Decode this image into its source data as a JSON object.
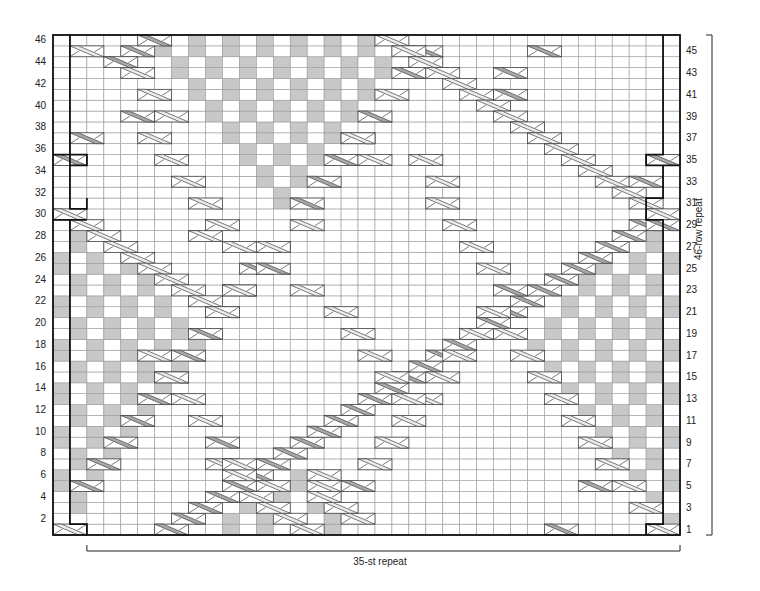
{
  "chart_data": {
    "type": "heatmap",
    "columns": 37,
    "rows": 46,
    "repeat_stitches_label": "35-st repeat",
    "repeat_rows_label": "46-row repeat",
    "left_row_labels": [
      2,
      4,
      6,
      8,
      10,
      12,
      14,
      16,
      18,
      20,
      22,
      24,
      26,
      28,
      30,
      32,
      34,
      36,
      38,
      40,
      42,
      44,
      46
    ],
    "right_row_labels": [
      1,
      3,
      5,
      7,
      9,
      11,
      13,
      15,
      17,
      19,
      21,
      23,
      25,
      27,
      29,
      31,
      33,
      35,
      37,
      39,
      41,
      43,
      45
    ],
    "colors": {
      "grid": "#9a9a9a",
      "shade": "#c8c8c8",
      "light_cross": "#ececec",
      "dark_cross": "#a8a8a8",
      "outline": "#111111"
    },
    "shaded_regions": [
      {
        "name": "top-center-diamond",
        "rows": [
          31,
          46
        ],
        "center_col": 13,
        "half_width_top": 10
      },
      {
        "name": "left-lower-triangle",
        "rows": [
          2,
          28
        ],
        "anchor": "left"
      },
      {
        "name": "right-lower-triangle",
        "rows": [
          2,
          28
        ],
        "anchor": "right"
      },
      {
        "name": "bottom-center-triangle",
        "rows": [
          1,
          6
        ],
        "center_col": 12
      }
    ],
    "crosses": [
      [
        1,
        0,
        "L"
      ],
      [
        1,
        6,
        "D"
      ],
      [
        2,
        7,
        "D"
      ],
      [
        3,
        8,
        "D"
      ],
      [
        4,
        9,
        "D"
      ],
      [
        5,
        10,
        "D"
      ],
      [
        6,
        11,
        "D"
      ],
      [
        7,
        12,
        "D"
      ],
      [
        8,
        13,
        "D"
      ],
      [
        9,
        14,
        "D"
      ],
      [
        10,
        15,
        "D"
      ],
      [
        11,
        16,
        "D"
      ],
      [
        12,
        17,
        "D"
      ],
      [
        13,
        18,
        "D"
      ],
      [
        14,
        19,
        "D"
      ],
      [
        15,
        20,
        "D"
      ],
      [
        16,
        21,
        "D"
      ],
      [
        17,
        22,
        "D"
      ],
      [
        18,
        23,
        "D"
      ],
      [
        19,
        24,
        "D"
      ],
      [
        20,
        25,
        "D"
      ],
      [
        21,
        26,
        "D"
      ],
      [
        22,
        27,
        "D"
      ],
      [
        23,
        28,
        "D"
      ],
      [
        24,
        29,
        "D"
      ],
      [
        25,
        30,
        "D"
      ],
      [
        26,
        31,
        "D"
      ],
      [
        27,
        32,
        "D"
      ],
      [
        28,
        33,
        "D"
      ],
      [
        29,
        34,
        "D"
      ],
      [
        1,
        14,
        "L"
      ],
      [
        2,
        13,
        "L"
      ],
      [
        3,
        12,
        "L"
      ],
      [
        4,
        11,
        "L"
      ],
      [
        5,
        12,
        "L"
      ],
      [
        6,
        10,
        "L"
      ],
      [
        7,
        9,
        "L"
      ],
      [
        1,
        35,
        "L"
      ],
      [
        1,
        29,
        "D"
      ],
      [
        3,
        34,
        "L"
      ],
      [
        5,
        31,
        "D"
      ],
      [
        5,
        33,
        "L"
      ],
      [
        7,
        32,
        "L"
      ],
      [
        9,
        31,
        "L"
      ],
      [
        11,
        30,
        "L"
      ],
      [
        13,
        29,
        "L"
      ],
      [
        15,
        28,
        "L"
      ],
      [
        17,
        27,
        "L"
      ],
      [
        19,
        26,
        "L"
      ],
      [
        21,
        25,
        "L"
      ],
      [
        23,
        26,
        "D"
      ],
      [
        2,
        17,
        "L"
      ],
      [
        3,
        16,
        "L"
      ],
      [
        4,
        15,
        "L"
      ],
      [
        5,
        17,
        "D"
      ],
      [
        7,
        18,
        "L"
      ],
      [
        9,
        19,
        "L"
      ],
      [
        11,
        20,
        "L"
      ],
      [
        13,
        21,
        "L"
      ],
      [
        15,
        22,
        "L"
      ],
      [
        17,
        23,
        "L"
      ],
      [
        19,
        24,
        "L"
      ],
      [
        21,
        25,
        "L"
      ],
      [
        5,
        1,
        "D"
      ],
      [
        7,
        2,
        "D"
      ],
      [
        9,
        3,
        "D"
      ],
      [
        11,
        4,
        "D"
      ],
      [
        13,
        5,
        "D"
      ],
      [
        15,
        6,
        "D"
      ],
      [
        17,
        7,
        "D"
      ],
      [
        19,
        8,
        "D"
      ],
      [
        21,
        9,
        "D"
      ],
      [
        23,
        10,
        "D"
      ],
      [
        25,
        11,
        "D"
      ],
      [
        27,
        12,
        "L"
      ],
      [
        7,
        10,
        "L"
      ],
      [
        9,
        9,
        "D"
      ],
      [
        11,
        8,
        "L"
      ],
      [
        13,
        7,
        "L"
      ],
      [
        15,
        6,
        "L"
      ],
      [
        17,
        5,
        "L"
      ],
      [
        6,
        15,
        "L"
      ],
      [
        5,
        15,
        "L"
      ],
      [
        30,
        0,
        "L"
      ],
      [
        29,
        1,
        "L"
      ],
      [
        28,
        2,
        "L"
      ],
      [
        27,
        3,
        "L"
      ],
      [
        26,
        4,
        "L"
      ],
      [
        25,
        5,
        "L"
      ],
      [
        24,
        6,
        "L"
      ],
      [
        23,
        7,
        "L"
      ],
      [
        22,
        8,
        "L"
      ],
      [
        21,
        9,
        "L"
      ],
      [
        23,
        10,
        "L"
      ],
      [
        25,
        12,
        "D"
      ],
      [
        27,
        10,
        "L"
      ],
      [
        28,
        8,
        "L"
      ],
      [
        29,
        9,
        "L"
      ],
      [
        31,
        8,
        "L"
      ],
      [
        33,
        7,
        "L"
      ],
      [
        35,
        6,
        "L"
      ],
      [
        37,
        5,
        "L"
      ],
      [
        39,
        4,
        "D"
      ],
      [
        39,
        6,
        "L"
      ],
      [
        41,
        5,
        "L"
      ],
      [
        43,
        4,
        "L"
      ],
      [
        45,
        1,
        "L"
      ],
      [
        45,
        4,
        "D"
      ],
      [
        44,
        3,
        "D"
      ],
      [
        46,
        5,
        "D"
      ],
      [
        37,
        1,
        "D"
      ],
      [
        35,
        0,
        "D"
      ],
      [
        35,
        35,
        "D"
      ],
      [
        23,
        14,
        "L"
      ],
      [
        21,
        16,
        "L"
      ],
      [
        19,
        17,
        "L"
      ],
      [
        17,
        18,
        "L"
      ],
      [
        15,
        19,
        "L"
      ],
      [
        13,
        20,
        "L"
      ],
      [
        27,
        12,
        "L"
      ],
      [
        29,
        14,
        "L"
      ],
      [
        31,
        14,
        "D"
      ],
      [
        33,
        15,
        "D"
      ],
      [
        35,
        16,
        "D"
      ],
      [
        37,
        17,
        "D"
      ],
      [
        39,
        18,
        "D"
      ],
      [
        41,
        19,
        "L"
      ],
      [
        43,
        20,
        "D"
      ],
      [
        45,
        21,
        "D"
      ],
      [
        46,
        19,
        "L"
      ],
      [
        45,
        20,
        "L"
      ],
      [
        44,
        21,
        "L"
      ],
      [
        43,
        22,
        "L"
      ],
      [
        42,
        23,
        "L"
      ],
      [
        41,
        24,
        "L"
      ],
      [
        40,
        25,
        "L"
      ],
      [
        39,
        26,
        "L"
      ],
      [
        38,
        27,
        "L"
      ],
      [
        37,
        28,
        "L"
      ],
      [
        36,
        29,
        "L"
      ],
      [
        35,
        30,
        "L"
      ],
      [
        34,
        31,
        "L"
      ],
      [
        33,
        32,
        "L"
      ],
      [
        32,
        33,
        "L"
      ],
      [
        31,
        34,
        "L"
      ],
      [
        30,
        35,
        "L"
      ],
      [
        29,
        35,
        "D"
      ],
      [
        33,
        34,
        "D"
      ],
      [
        41,
        26,
        "D"
      ],
      [
        43,
        26,
        "D"
      ],
      [
        45,
        28,
        "D"
      ],
      [
        35,
        21,
        "L"
      ],
      [
        33,
        22,
        "L"
      ],
      [
        31,
        22,
        "L"
      ],
      [
        29,
        23,
        "L"
      ],
      [
        27,
        24,
        "L"
      ],
      [
        25,
        25,
        "L"
      ],
      [
        35,
        18,
        "L"
      ],
      [
        37,
        17,
        "L"
      ]
    ]
  }
}
